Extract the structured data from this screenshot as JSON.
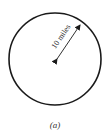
{
  "figure": {
    "shape": "circle",
    "radius_label": "10 miles",
    "caption": "(a)",
    "colors": {
      "stroke": "#1a1a1a",
      "text": "#222222",
      "background": "#ffffff"
    }
  }
}
